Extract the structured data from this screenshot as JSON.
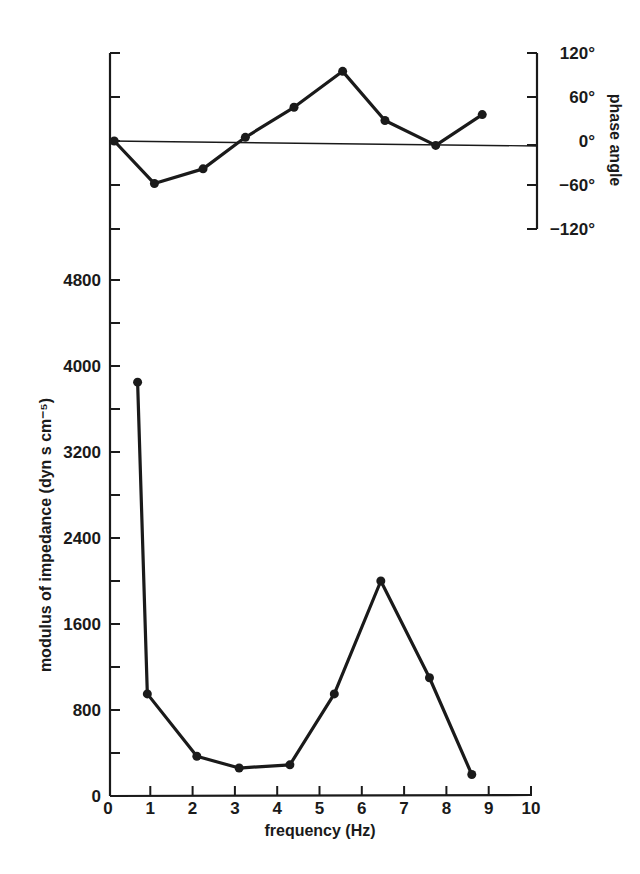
{
  "chart_data": [
    {
      "id": "phase",
      "type": "line",
      "title": "",
      "xlabel": "",
      "ylabel": "phase angle",
      "ylim": [
        -120,
        120
      ],
      "yticks": [
        120,
        60,
        0,
        -60,
        -120
      ],
      "ytick_labels": [
        "120°",
        "60°",
        "0°",
        "−60°",
        "−120°"
      ],
      "reference_line": 0,
      "grid": false,
      "x": [
        0.1,
        1.05,
        2.2,
        3.2,
        4.35,
        5.5,
        6.5,
        7.7,
        8.8
      ],
      "values": [
        0,
        -58,
        -38,
        5,
        46,
        95,
        28,
        -6,
        36
      ],
      "marker": "filled-circle"
    },
    {
      "id": "modulus",
      "type": "line",
      "title": "",
      "xlabel": "frequency (Hz)",
      "ylabel": "modulus of impedance (dyn s cm⁻⁵)",
      "xlim": [
        0,
        10
      ],
      "ylim": [
        0,
        4800
      ],
      "xticks": [
        0,
        1,
        2,
        3,
        4,
        5,
        6,
        7,
        8,
        9,
        10
      ],
      "yticks": [
        0,
        800,
        1600,
        2400,
        3200,
        4000,
        4800
      ],
      "grid": false,
      "x": [
        0.7,
        0.93,
        2.1,
        3.1,
        4.3,
        5.35,
        6.45,
        7.6,
        8.6
      ],
      "values": [
        3850,
        950,
        370,
        260,
        290,
        950,
        2000,
        1100,
        200
      ],
      "marker": "filled-circle"
    }
  ],
  "labels": {
    "xlabel": "frequency (Hz)",
    "ylabel_bottom": "modulus of impedance (dyn s cm⁻⁵)",
    "ylabel_top": "phase angle"
  }
}
